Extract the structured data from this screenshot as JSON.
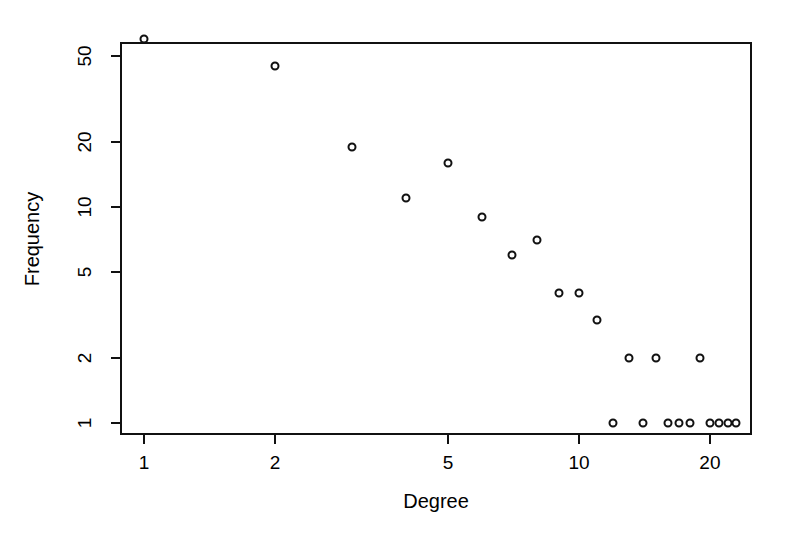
{
  "chart_data": {
    "type": "scatter",
    "title": "",
    "xlabel": "Degree",
    "ylabel": "Frequency",
    "xscale": "log",
    "yscale": "log",
    "xticks": [
      1,
      2,
      5,
      10,
      20
    ],
    "xtick_labels": [
      "1",
      "2",
      "5",
      "10",
      "20"
    ],
    "yticks": [
      1,
      2,
      5,
      10,
      20,
      50
    ],
    "ytick_labels": [
      "1",
      "2",
      "5",
      "10",
      "20",
      "50"
    ],
    "xlim": [
      0.93,
      26
    ],
    "ylim": [
      0.87,
      72
    ],
    "grid": false,
    "legend": null,
    "marker": "open-circle",
    "marker_color": "#111111",
    "points": [
      {
        "x": 1,
        "y": 60
      },
      {
        "x": 2,
        "y": 45
      },
      {
        "x": 3,
        "y": 19
      },
      {
        "x": 4,
        "y": 11
      },
      {
        "x": 5,
        "y": 16
      },
      {
        "x": 6,
        "y": 9
      },
      {
        "x": 7,
        "y": 6
      },
      {
        "x": 8,
        "y": 7
      },
      {
        "x": 9,
        "y": 4
      },
      {
        "x": 10,
        "y": 4
      },
      {
        "x": 11,
        "y": 3
      },
      {
        "x": 12,
        "y": 1
      },
      {
        "x": 13,
        "y": 2
      },
      {
        "x": 14,
        "y": 1
      },
      {
        "x": 15,
        "y": 2
      },
      {
        "x": 16,
        "y": 1
      },
      {
        "x": 17,
        "y": 1
      },
      {
        "x": 18,
        "y": 1
      },
      {
        "x": 19,
        "y": 2
      },
      {
        "x": 20,
        "y": 1
      },
      {
        "x": 21,
        "y": 1
      },
      {
        "x": 22,
        "y": 1
      },
      {
        "x": 23,
        "y": 1
      }
    ]
  },
  "geometry": {
    "frame": {
      "left": 120,
      "top": 42,
      "right": 752,
      "bottom": 435
    },
    "x_map": {
      "ref_value": 1,
      "ref_px": 144,
      "px_per_decade": 435
    },
    "y_map": {
      "ref_value": 1,
      "ref_px": 423,
      "px_per_decade": 216
    }
  }
}
